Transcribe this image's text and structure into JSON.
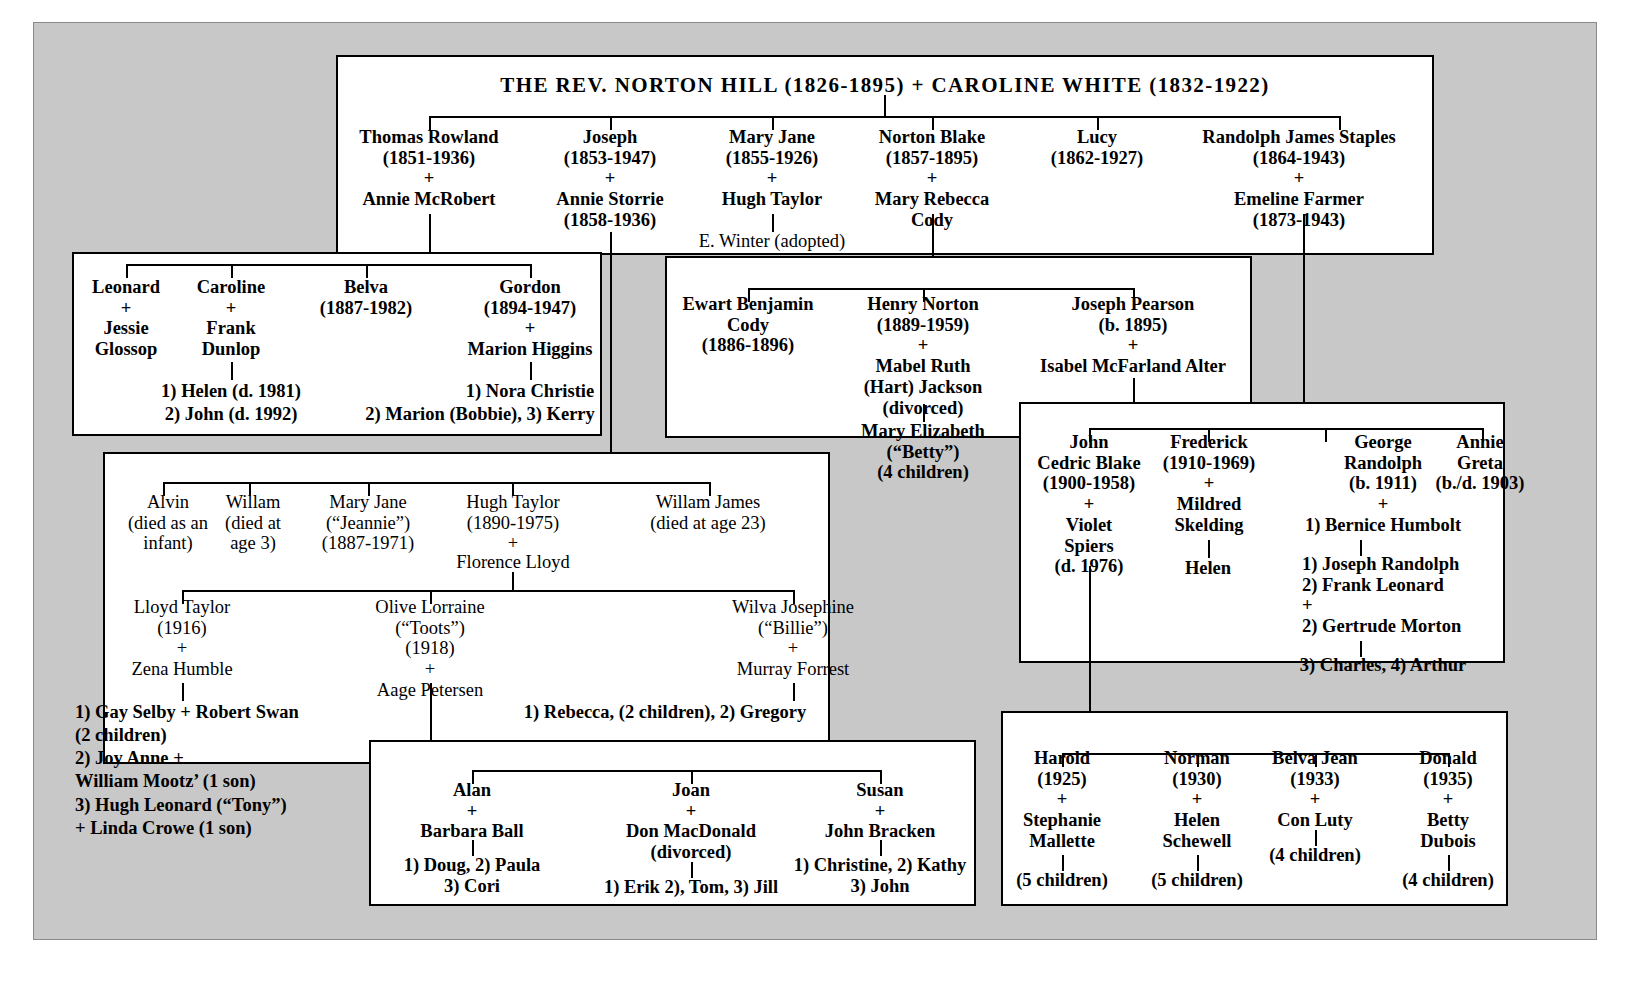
{
  "chart": {
    "type": "genealogy-tree",
    "title": "THE REV. NORTON HILL  (1826-1895)  +  CAROLINE WHITE  (1832-1922)"
  },
  "gen1": {
    "title": "THE REV. NORTON HILL  (1826-1895)  +  CAROLINE WHITE  (1832-1922)"
  },
  "gen2": {
    "thomas": "Thomas Rowland\n(1851-1936)\n+\nAnnie McRobert",
    "joseph": "Joseph\n(1853-1947)\n+\nAnnie Storrie\n(1858-1936)",
    "maryjane": "Mary Jane\n(1855-1926)\n+\nHugh Taylor",
    "maryjane_adopted": "E. Winter (adopted)",
    "nortonblake": "Norton Blake\n(1857-1895)\n+\nMary Rebecca\nCody",
    "lucy": "Lucy\n(1862-1927)",
    "randolph": "Randolph James Staples\n(1864-1943)\n+\nEmeline Farmer\n(1873-1943)"
  },
  "box_thomas": {
    "leonard": "Leonard\n+\nJessie\nGlossop",
    "caroline": "Caroline\n+\nFrank\nDunlop",
    "belva": "Belva\n(1887-1982)",
    "gordon": "Gordon\n(1894-1947)\n+\nMarion Higgins",
    "caroline_children_1": "1) Helen (d. 1981)",
    "caroline_children_2": "2) John (d. 1992)",
    "gordon_children_1": "1) Nora Christie",
    "gordon_children_2": "2) Marion (Bobbie), 3) Kerry"
  },
  "box_nortonblake": {
    "ewart": "Ewart Benjamin\nCody\n(1886-1896)",
    "henry": "Henry Norton\n(1889-1959)\n+\nMabel Ruth\n(Hart) Jackson\n(divorced)",
    "henry_child": "Mary Elizabeth\n(“Betty”)\n(4 children)",
    "josephpearson": "Joseph Pearson\n(b. 1895)\n+\nIsabel McFarland Alter"
  },
  "box_maryjane": {
    "alvin": "Alvin\n(died as an\ninfant)",
    "willam": "Willam\n(died at\nage 3)",
    "maryjane2": "Mary Jane\n(“Jeannie”)\n(1887-1971)",
    "hughtaylor": "Hugh Taylor\n(1890-1975)\n+",
    "florence": "Florence Lloyd",
    "willamjames": "Willam James\n(died at age 23)",
    "lloyd": "Lloyd Taylor\n(1916)\n+\nZena Humble",
    "lloyd_children": "1) Gay Selby + Robert Swan\n(2 children)\n2) Joy Anne +\nWilliam Mootz’ (1 son)\n3) Hugh Leonard (“Tony”)\n+ Linda Crowe   (1 son)",
    "olive": "Olive Lorraine\n(“Toots”)\n(1918)\n+\nAage Petersen",
    "wilva": "Wilva Josephine\n(“Billie”)\n+\nMurray Forrest",
    "wilva_children": "1) Rebecca, (2 children), 2) Gregory"
  },
  "box_olive": {
    "alan": "Alan\n+\nBarbara Ball",
    "alan_children": "1) Doug, 2) Paula\n3) Cori",
    "joan": "Joan\n+\nDon MacDonald\n(divorced)",
    "joan_children": "1) Erik 2), Tom, 3) Jill",
    "susan": "Susan\n+\nJohn Bracken",
    "susan_children": "1) Christine, 2) Kathy\n3) John"
  },
  "box_josephpearson": {
    "john": "John\nCedric Blake\n(1900-1958)\n+\nViolet\nSpiers\n(d. 1976)",
    "frederick": "Frederick\n(1910-1969)\n+\nMildred\nSkelding",
    "frederick_child": "Helen",
    "george": "George\nRandolph\n(b. 1911)\n+\n1) Bernice Humbolt",
    "george_children": "1) Joseph Randolph\n2) Frank Leonard\n+\n2) Gertrude Morton",
    "george_children2": "3) Charles,    4) Arthur",
    "annie": "Annie\nGreta\n(b./d. 1903)"
  },
  "box_john": {
    "harold": "Harold\n(1925)\n+\nStephanie\nMallette",
    "harold_children": "(5 children)",
    "norman": "Norman\n(1930)\n+\nHelen\nSchewell",
    "norman_children": "(5 children)",
    "belvajean": "Belva Jean\n(1933)\n+\nCon Luty",
    "belvajean_children": "(4 children)",
    "donald": "Donald\n(1935)\n+\nBetty\nDubois",
    "donald_children": "(4 children)"
  }
}
